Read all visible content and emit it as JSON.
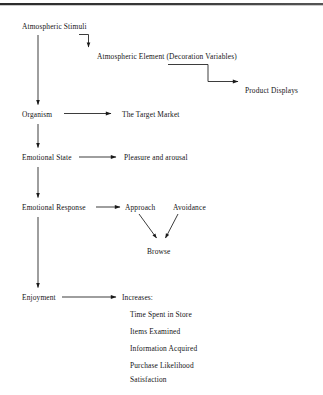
{
  "diagram": {
    "type": "flowchart",
    "background_color": "#ffffff",
    "line_color": "#1a1a1a",
    "text_color": "#141414",
    "top_rule_color": "#2b2b2b"
  },
  "nodes": {
    "atmospheric_stimuli": "Atmospheric Stimuli",
    "atmospheric_element": "Atmospheric Element (Decoration Variables)",
    "product_displays": "Product Displays",
    "organism": "Organism",
    "target_market": "The Target Market",
    "emotional_state": "Emotional State",
    "pleasure_and_arousal": "Pleasure and arousal",
    "emotional_response": "Emotional Response",
    "approach": "Approach",
    "avoidance": "Avoidance",
    "browse": "Browse",
    "enjoyment": "Enjoyment",
    "increases": "Increases:"
  },
  "increases_list": [
    "Time Spent in Store",
    "Items Examined",
    "Information Acquired",
    "Purchase Likelihood",
    "Satisfaction"
  ],
  "edges": [
    {
      "from": "atmospheric_stimuli",
      "to": "atmospheric_element",
      "style": "elbow"
    },
    {
      "from": "atmospheric_element",
      "to": "product_displays",
      "style": "elbow"
    },
    {
      "from": "atmospheric_stimuli",
      "to": "organism",
      "style": "vertical"
    },
    {
      "from": "organism",
      "to": "target_market",
      "style": "horizontal"
    },
    {
      "from": "organism",
      "to": "emotional_state",
      "style": "vertical"
    },
    {
      "from": "emotional_state",
      "to": "pleasure_and_arousal",
      "style": "horizontal"
    },
    {
      "from": "emotional_state",
      "to": "emotional_response",
      "style": "vertical"
    },
    {
      "from": "emotional_response",
      "to": "approach",
      "style": "horizontal"
    },
    {
      "from": "approach",
      "to": "browse",
      "style": "diagonal"
    },
    {
      "from": "avoidance",
      "to": "browse",
      "style": "diagonal"
    },
    {
      "from": "emotional_response",
      "to": "enjoyment",
      "style": "vertical"
    },
    {
      "from": "enjoyment",
      "to": "increases",
      "style": "horizontal"
    }
  ]
}
